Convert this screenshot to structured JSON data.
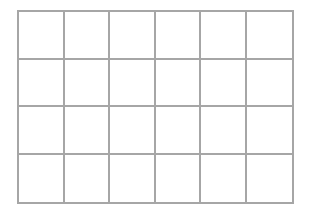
{
  "grid": {
    "rows": 4,
    "columns": 6,
    "line_color": "#a6a6a6",
    "background": "#ffffff",
    "cells": [
      [
        "",
        "",
        "",
        "",
        "",
        ""
      ],
      [
        "",
        "",
        "",
        "",
        "",
        ""
      ],
      [
        "",
        "",
        "",
        "",
        "",
        ""
      ],
      [
        "",
        "",
        "",
        "",
        "",
        ""
      ]
    ]
  }
}
